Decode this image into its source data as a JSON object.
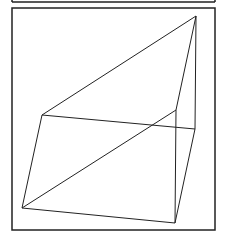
{
  "figure": {
    "stroke_color": "#222222",
    "background": "#ffffff",
    "top_strip": {
      "x1": 12,
      "y1": 0,
      "x2": 215,
      "y2": 2
    },
    "frame": {
      "x": 12,
      "y": 8,
      "width": 203,
      "height": 222
    },
    "vertices": {
      "apex": [
        196,
        16
      ],
      "back_left": [
        42,
        115
      ],
      "back_right": [
        176,
        110
      ],
      "front_right": [
        195,
        129
      ],
      "bottom_left": [
        22,
        208
      ],
      "bottom_right": [
        175,
        223
      ]
    },
    "edges": [
      [
        "apex",
        "back_left"
      ],
      [
        "apex",
        "back_right"
      ],
      [
        "back_left",
        "front_right"
      ],
      [
        "back_left",
        "bottom_left"
      ],
      [
        "bottom_left",
        "back_right"
      ],
      [
        "bottom_left",
        "bottom_right"
      ],
      [
        "back_right",
        "bottom_right"
      ],
      [
        "front_right",
        "bottom_right"
      ],
      [
        "apex",
        "front_right"
      ]
    ]
  }
}
